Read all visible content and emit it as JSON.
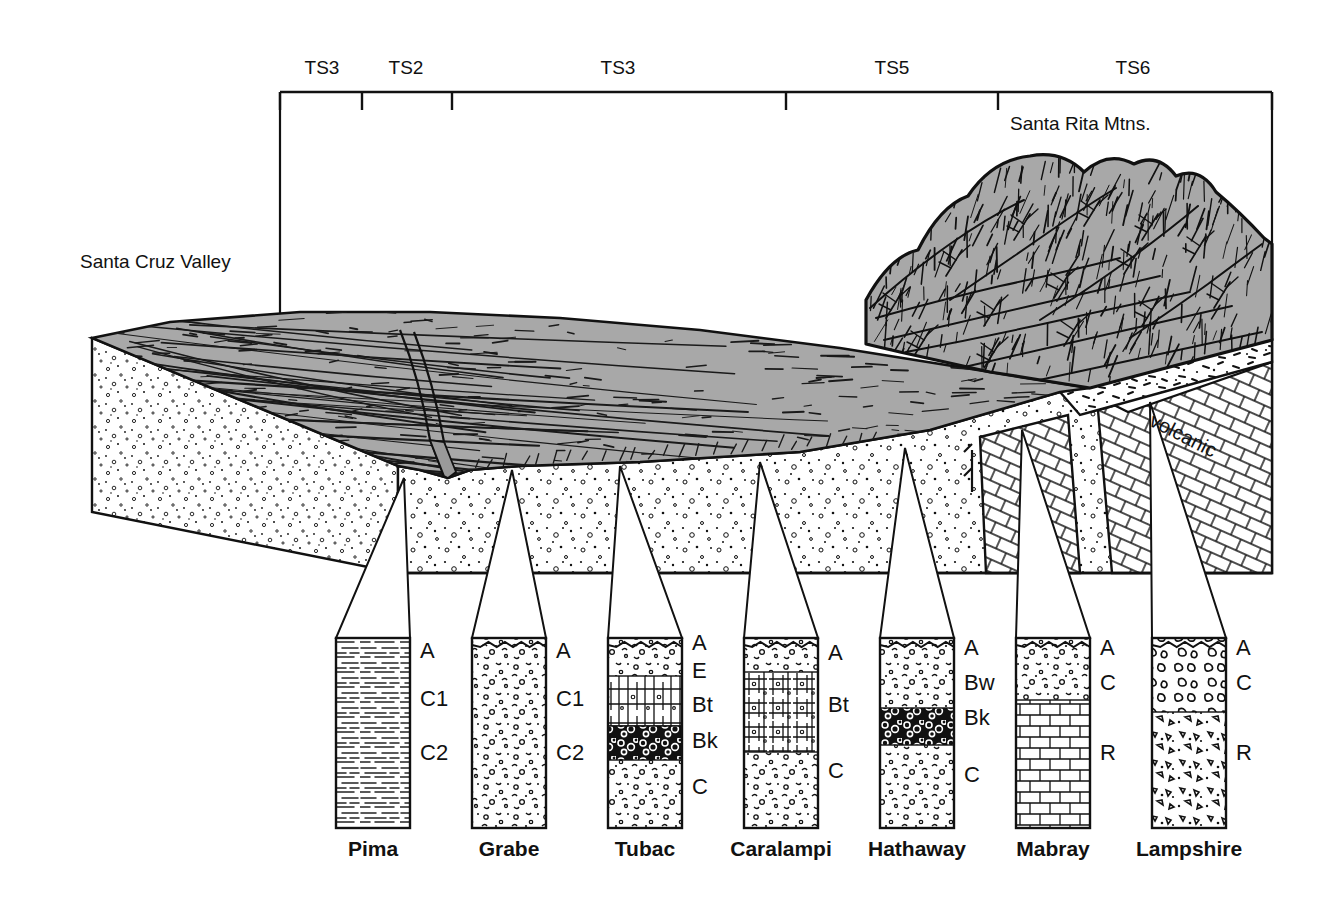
{
  "figure": {
    "type": "geologic-block-diagram",
    "background_color": "#ffffff",
    "ink_color": "#000000",
    "surface_gray": "#a8a8a8"
  },
  "scale_bar": {
    "label_note": "terrace / geomorphic surface units along the top axis",
    "segments": [
      {
        "label": "TS3",
        "x_center": 322
      },
      {
        "label": "TS2",
        "x_center": 406
      },
      {
        "label": "TS3",
        "x_center": 618
      },
      {
        "label": "TS5",
        "x_center": 892
      },
      {
        "label": "TS6",
        "x_center": 1133
      }
    ],
    "ticks": [
      280,
      362,
      452,
      786,
      998,
      1272
    ],
    "axis_y": 92,
    "left_x": 280,
    "right_x": 1272
  },
  "block": {
    "labels": [
      {
        "name": "valley-label",
        "text": "Santa Cruz Valley",
        "x": 80,
        "y": 268
      },
      {
        "name": "mountain-label",
        "text": "Santa Rita Mtns.",
        "x": 1010,
        "y": 130
      },
      {
        "name": "volcanic-label",
        "text": "volcanic",
        "x": 1148,
        "y": 425,
        "rotation": 27
      }
    ],
    "units": {
      "surface": "alluvial fan / piedmont surface (gray)",
      "alluvium": "basin-fill alluvium (stipple)",
      "limestone": "limestone bedrock (brick pattern)",
      "volcanic": "volcanic rock (dash stipple)"
    }
  },
  "profiles": [
    {
      "name": "Pima",
      "x": 336,
      "width": 74,
      "top": 638,
      "bottom": 828,
      "pattern": "silty-laminated",
      "horizons": [
        {
          "label": "A",
          "y": 658
        },
        {
          "label": "C1",
          "y": 706
        },
        {
          "label": "C2",
          "y": 760
        }
      ]
    },
    {
      "name": "Grabe",
      "x": 472,
      "width": 74,
      "top": 638,
      "bottom": 828,
      "pattern": "gravelly-stipple",
      "horizons": [
        {
          "label": "A",
          "y": 658
        },
        {
          "label": "C1",
          "y": 706
        },
        {
          "label": "C2",
          "y": 760
        }
      ]
    },
    {
      "name": "Tubac",
      "x": 608,
      "width": 74,
      "top": 638,
      "bottom": 828,
      "pattern": "argillic-calcic",
      "horizons": [
        {
          "label": "A",
          "y": 650
        },
        {
          "label": "E",
          "y": 678
        },
        {
          "label": "Bt",
          "y": 712
        },
        {
          "label": "Bk",
          "y": 748
        },
        {
          "label": "C",
          "y": 794
        }
      ],
      "bands": [
        {
          "label": "Bt",
          "top": 676,
          "bottom": 726,
          "fill": "prismatic"
        },
        {
          "label": "Bk",
          "top": 726,
          "bottom": 760,
          "fill": "carbonate-nodules"
        }
      ]
    },
    {
      "name": "Caralampi",
      "x": 744,
      "width": 74,
      "top": 638,
      "bottom": 828,
      "pattern": "argillic-gravelly",
      "horizons": [
        {
          "label": "A",
          "y": 660
        },
        {
          "label": "Bt",
          "y": 712
        },
        {
          "label": "C",
          "y": 778
        }
      ],
      "bands": [
        {
          "label": "Bt",
          "top": 672,
          "bottom": 752,
          "fill": "blocky-structure"
        }
      ]
    },
    {
      "name": "Hathaway",
      "x": 880,
      "width": 74,
      "top": 638,
      "bottom": 828,
      "pattern": "calcic-gravelly",
      "horizons": [
        {
          "label": "A",
          "y": 655
        },
        {
          "label": "Bw",
          "y": 690
        },
        {
          "label": "Bk",
          "y": 725
        },
        {
          "label": "C",
          "y": 782
        }
      ],
      "bands": [
        {
          "label": "Bk",
          "top": 708,
          "bottom": 745,
          "fill": "carbonate-nodules"
        }
      ]
    },
    {
      "name": "Mabray",
      "x": 1016,
      "width": 74,
      "top": 638,
      "bottom": 828,
      "pattern": "shallow-over-limestone",
      "horizons": [
        {
          "label": "A",
          "y": 655
        },
        {
          "label": "C",
          "y": 690
        },
        {
          "label": "R",
          "y": 760
        }
      ],
      "bands": [
        {
          "label": "R",
          "top": 700,
          "bottom": 828,
          "fill": "limestone-brick"
        }
      ]
    },
    {
      "name": "Lampshire",
      "x": 1152,
      "width": 74,
      "top": 638,
      "bottom": 828,
      "pattern": "shallow-over-volcanic",
      "horizons": [
        {
          "label": "A",
          "y": 655
        },
        {
          "label": "C",
          "y": 690
        },
        {
          "label": "R",
          "y": 760
        }
      ],
      "bands": [
        {
          "label": "R",
          "top": 712,
          "bottom": 828,
          "fill": "angular-fragments"
        }
      ]
    }
  ]
}
